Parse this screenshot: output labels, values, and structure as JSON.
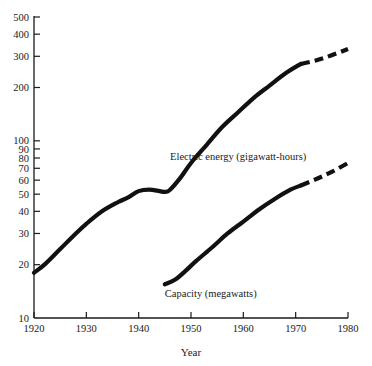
{
  "chart_data": {
    "type": "line",
    "title": "",
    "xlabel": "Year",
    "ylabel": "",
    "yscale": "log",
    "ylim": [
      10,
      500
    ],
    "xlim": [
      1920,
      1980
    ],
    "grid": false,
    "legend": "inline-annotations",
    "x_ticks": [
      1920,
      1930,
      1940,
      1950,
      1960,
      1970,
      1980
    ],
    "x_tick_labels": [
      "1920",
      "1930",
      "1940",
      "1950",
      "1960",
      "1970",
      "1980"
    ],
    "y_ticks": [
      10,
      20,
      30,
      40,
      50,
      60,
      70,
      80,
      90,
      100,
      200,
      300,
      400,
      500
    ],
    "y_tick_labels": [
      "10",
      "20",
      "30",
      "40",
      "50",
      "60",
      "70",
      "80",
      "90",
      "100",
      "200",
      "300",
      "400",
      "500"
    ],
    "series": [
      {
        "name": "Electric energy (gigawatt-hours)",
        "label": "Electric energy (gigawatt-hours)",
        "style": "solid-then-dashed",
        "solid": {
          "x": [
            1920,
            1922,
            1925,
            1928,
            1930,
            1933,
            1936,
            1938,
            1940,
            1942,
            1944,
            1945,
            1946,
            1948,
            1950,
            1953,
            1956,
            1959,
            1962,
            1965,
            1968,
            1971
          ],
          "y": [
            18,
            20,
            24.5,
            30,
            34,
            40,
            45,
            48,
            52,
            53,
            52,
            51.5,
            53,
            62,
            75,
            95,
            120,
            145,
            175,
            205,
            240,
            272
          ]
        },
        "dashed_projection": {
          "x": [
            1971,
            1974,
            1977,
            1980
          ],
          "y": [
            272,
            285,
            305,
            330
          ]
        }
      },
      {
        "name": "Capacity (megawatts)",
        "label": "Capacity (megawatts)",
        "style": "solid-then-dashed",
        "solid": {
          "x": [
            1945,
            1947,
            1949,
            1951,
            1954,
            1957,
            1960,
            1963,
            1966,
            1969,
            1971
          ],
          "y": [
            15.5,
            16.5,
            18.5,
            21,
            25,
            30,
            35,
            41,
            47,
            53,
            56
          ]
        },
        "dashed_projection": {
          "x": [
            1971,
            1974,
            1977,
            1980
          ],
          "y": [
            56,
            61,
            67,
            75
          ]
        }
      }
    ],
    "annotations": [
      {
        "text": "Electric energy (gigawatt-hours)",
        "x": 1946,
        "y": 78
      },
      {
        "text": "Capacity (megawatts)",
        "x": 1945,
        "y": 13.2
      }
    ]
  },
  "axis": {
    "x_title": "Year"
  }
}
